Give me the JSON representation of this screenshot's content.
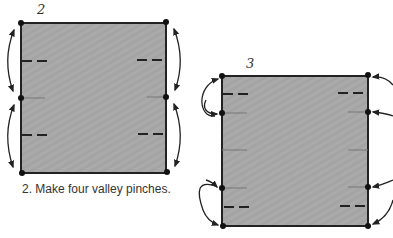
{
  "diagram": {
    "colors": {
      "paper_fill": "#aaaaaa",
      "outline": "#222222",
      "pinch_line": "#777777",
      "background": "#ffffff"
    },
    "steps": [
      {
        "number": "2",
        "caption": "2. Make four valley pinches.",
        "square": {
          "x": 21,
          "y": 23,
          "w": 145,
          "h": 150
        },
        "dots": [
          [
            21,
            23
          ],
          [
            166,
            22
          ],
          [
            21,
            98
          ],
          [
            166,
            97
          ],
          [
            21,
            173
          ],
          [
            166,
            172
          ]
        ],
        "valley_dashes": [
          {
            "x1": 22,
            "y1": 61,
            "x2": 50,
            "y2": 61
          },
          {
            "x1": 137,
            "y1": 60,
            "x2": 165,
            "y2": 60
          },
          {
            "x1": 22,
            "y1": 135,
            "x2": 51,
            "y2": 135
          },
          {
            "x1": 138,
            "y1": 134,
            "x2": 165,
            "y2": 134
          }
        ],
        "pinch_lines": [
          {
            "x1": 21,
            "y1": 98,
            "x2": 45,
            "y2": 98
          },
          {
            "x1": 147,
            "y1": 97,
            "x2": 166,
            "y2": 97
          }
        ],
        "arrows": "two-way valley arrows on each side between corner and midpoint"
      },
      {
        "number": "3",
        "caption": "",
        "square": {
          "x": 222,
          "y": 76,
          "w": 146,
          "h": 150
        },
        "dots": [
          [
            222,
            76
          ],
          [
            368,
            75
          ],
          [
            222,
            113
          ],
          [
            368,
            112
          ],
          [
            222,
            188
          ],
          [
            368,
            187
          ],
          [
            223,
            226
          ],
          [
            368,
            226
          ]
        ],
        "valley_dashes": [
          {
            "x1": 223,
            "y1": 94,
            "x2": 252,
            "y2": 94
          },
          {
            "x1": 338,
            "y1": 93,
            "x2": 367,
            "y2": 93
          },
          {
            "x1": 224,
            "y1": 207,
            "x2": 253,
            "y2": 207
          },
          {
            "x1": 340,
            "y1": 206,
            "x2": 367,
            "y2": 206
          }
        ],
        "pinch_lines": [
          {
            "x1": 222,
            "y1": 113,
            "x2": 247,
            "y2": 113
          },
          {
            "x1": 348,
            "y1": 112,
            "x2": 368,
            "y2": 112
          },
          {
            "x1": 222,
            "y1": 150,
            "x2": 247,
            "y2": 150
          },
          {
            "x1": 348,
            "y1": 150,
            "x2": 368,
            "y2": 150
          },
          {
            "x1": 222,
            "y1": 188,
            "x2": 247,
            "y2": 188
          },
          {
            "x1": 348,
            "y1": 187,
            "x2": 368,
            "y2": 187
          }
        ],
        "arrows": "curved arrows bringing corners toward quarter pinches"
      }
    ]
  }
}
